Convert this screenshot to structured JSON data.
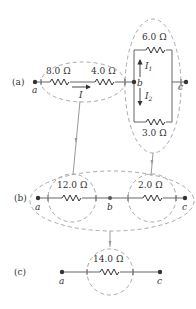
{
  "panels": {
    "a": {
      "label": "(a)",
      "nodes": {
        "a": "a",
        "b": "b",
        "c": "c"
      },
      "resistors": {
        "r1": "8.0 Ω",
        "r2": "4.0 Ω",
        "r_top": "6.0 Ω",
        "r_bottom": "3.0 Ω"
      },
      "currents": {
        "main": "I",
        "branch1": "I",
        "branch1_sub": "1",
        "branch2": "I",
        "branch2_sub": "2"
      }
    },
    "b": {
      "label": "(b)",
      "nodes": {
        "a": "a",
        "b": "b",
        "c": "c"
      },
      "resistors": {
        "r1": "12.0 Ω",
        "r2": "2.0 Ω"
      }
    },
    "c": {
      "label": "(c)",
      "nodes": {
        "a": "a",
        "c": "c"
      },
      "resistors": {
        "r1": "14.0 Ω"
      }
    }
  },
  "colors": {
    "wire": "#555555",
    "dashed_group": "#a9a9a9",
    "flow_arrow": "#999999"
  }
}
